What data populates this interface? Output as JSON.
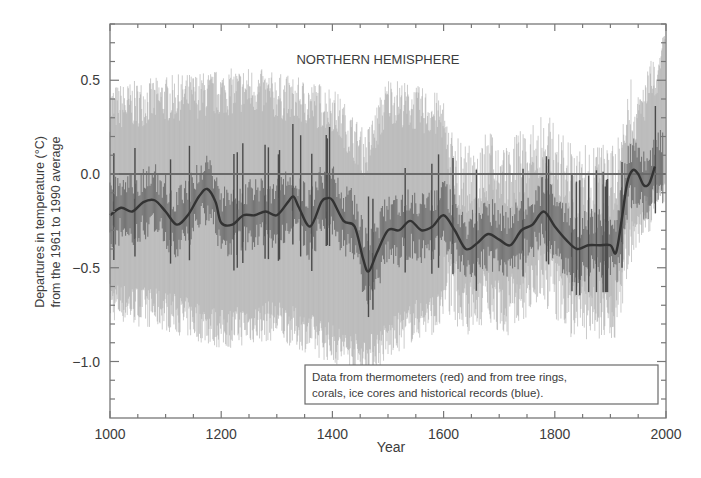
{
  "chart_data": {
    "type": "line",
    "title": "NORTHERN HEMISPHERE",
    "xlabel": "Year",
    "ylabel": [
      "Departures in temperature (°C)",
      "from the 1961 to 1990 average"
    ],
    "xlim": [
      1000,
      2000
    ],
    "ylim": [
      -1.3,
      0.8
    ],
    "grid": false,
    "reference_line": 0.0,
    "x_ticks": [
      1000,
      1200,
      1400,
      1600,
      1800,
      2000
    ],
    "x_tick_labels": [
      "1000",
      "1200",
      "1400",
      "1600",
      "1800",
      "2000"
    ],
    "y_ticks": [
      0.5,
      0.0,
      -0.5,
      -1.0
    ],
    "y_tick_labels": [
      "0.5",
      "0.0",
      "−0.5",
      "−1.0"
    ],
    "legend": {
      "position": "lower right",
      "lines": [
        "Data from thermometers (red) and from tree rings,",
        "corals, ice cores and historical records (blue)."
      ]
    },
    "series": [
      {
        "name": "Smoothed reconstruction (50-year)",
        "style": "thick dark line",
        "x": [
          1000,
          1020,
          1040,
          1060,
          1080,
          1100,
          1120,
          1140,
          1160,
          1175,
          1190,
          1200,
          1220,
          1240,
          1260,
          1280,
          1300,
          1320,
          1330,
          1340,
          1360,
          1380,
          1390,
          1400,
          1420,
          1440,
          1455,
          1465,
          1480,
          1500,
          1520,
          1540,
          1560,
          1580,
          1600,
          1620,
          1640,
          1660,
          1680,
          1700,
          1720,
          1740,
          1760,
          1780,
          1800,
          1820,
          1840,
          1860,
          1880,
          1900,
          1910,
          1920,
          1930,
          1940,
          1950,
          1960,
          1970,
          1980
        ],
        "values": [
          -0.22,
          -0.18,
          -0.2,
          -0.15,
          -0.14,
          -0.2,
          -0.27,
          -0.22,
          -0.12,
          -0.08,
          -0.15,
          -0.26,
          -0.27,
          -0.22,
          -0.22,
          -0.2,
          -0.22,
          -0.15,
          -0.12,
          -0.18,
          -0.28,
          -0.15,
          -0.13,
          -0.14,
          -0.25,
          -0.28,
          -0.45,
          -0.52,
          -0.42,
          -0.3,
          -0.3,
          -0.25,
          -0.3,
          -0.28,
          -0.22,
          -0.3,
          -0.4,
          -0.37,
          -0.32,
          -0.35,
          -0.38,
          -0.3,
          -0.27,
          -0.2,
          -0.28,
          -0.35,
          -0.4,
          -0.38,
          -0.38,
          -0.38,
          -0.42,
          -0.25,
          -0.05,
          0.02,
          0.0,
          -0.06,
          -0.05,
          0.04
        ]
      },
      {
        "name": "Annual thermometer + proxy data (dark)",
        "style": "dark thin vertical spikes",
        "range_hint": "roughly ±0.25 around smoothed curve; extends to 0.25 in 1980s"
      },
      {
        "name": "Uncertainty band (light grey)",
        "style": "light grey shading",
        "upper_approx": [
          [
            1000,
            0.35
          ],
          [
            1100,
            0.4
          ],
          [
            1250,
            0.45
          ],
          [
            1400,
            0.35
          ],
          [
            1460,
            0.1
          ],
          [
            1500,
            0.4
          ],
          [
            1600,
            0.3
          ],
          [
            1610,
            0.1
          ],
          [
            1800,
            0.1
          ],
          [
            1900,
            0.05
          ],
          [
            1950,
            0.3
          ],
          [
            2000,
            0.7
          ]
        ],
        "lower_approx": [
          [
            1000,
            -0.7
          ],
          [
            1100,
            -0.75
          ],
          [
            1200,
            -0.85
          ],
          [
            1300,
            -0.8
          ],
          [
            1460,
            -1.0
          ],
          [
            1550,
            -0.8
          ],
          [
            1600,
            -0.75
          ],
          [
            1700,
            -0.65
          ],
          [
            1800,
            -0.6
          ],
          [
            1900,
            -0.6
          ],
          [
            1950,
            -0.3
          ],
          [
            2000,
            -0.1
          ]
        ]
      }
    ]
  }
}
